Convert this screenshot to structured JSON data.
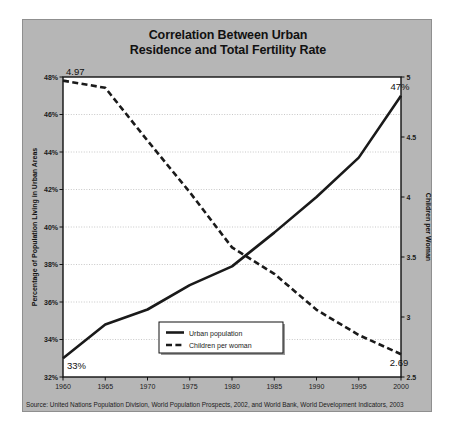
{
  "title": {
    "line1": "Correlation Between Urban",
    "line2": "Residence and Total Fertility Rate"
  },
  "source": "Source: United Nations Population Division, World Population Prospects, 2002, and World Bank, World Development Indicators, 2003",
  "legend": {
    "items": [
      {
        "label": "Urban population",
        "style": "solid"
      },
      {
        "label": "Children per woman",
        "style": "dashed"
      }
    ]
  },
  "annotations": {
    "urban_start": "33%",
    "urban_end": "47%",
    "fertility_start": "4.97",
    "fertility_end": "2.69"
  },
  "colors": {
    "frame": "#b6b6b6",
    "plot_background": "#ffffff",
    "line": "#1a1a1a",
    "grid": "#b0b0b0",
    "text": "#111111"
  },
  "chart_data": {
    "type": "line",
    "title": "Correlation Between Urban Residence and Total Fertility Rate",
    "xlabel": "",
    "ylabel": "Percentage of Population Living in Urban Areas",
    "y2label": "Children per Woman",
    "grid": true,
    "legend_position": "inside-bottom-center",
    "x": [
      1960,
      1965,
      1970,
      1975,
      1980,
      1985,
      1990,
      1995,
      2000
    ],
    "xtick_labels": [
      "1960",
      "1965",
      "1970",
      "1975",
      "1980",
      "1985",
      "1990",
      "1995",
      "2000"
    ],
    "xlim": [
      1960,
      2000
    ],
    "ylim": [
      32,
      48
    ],
    "ytick_labels": [
      "32%",
      "34%",
      "36%",
      "38%",
      "40%",
      "42%",
      "44%",
      "46%",
      "48%"
    ],
    "ytick_values": [
      32,
      34,
      36,
      38,
      40,
      42,
      44,
      46,
      48
    ],
    "y2lim": [
      2.5,
      5.0
    ],
    "y2tick_labels": [
      "2.5",
      "3",
      "3.5",
      "4",
      "4.5",
      "5"
    ],
    "y2tick_values": [
      2.5,
      3.0,
      3.5,
      4.0,
      4.5,
      5.0
    ],
    "series": [
      {
        "name": "Urban population",
        "axis": "left",
        "style": "solid",
        "unit": "%",
        "values": [
          33.0,
          34.8,
          35.6,
          36.9,
          37.9,
          39.7,
          41.6,
          43.7,
          47.0
        ]
      },
      {
        "name": "Children per woman",
        "axis": "right",
        "style": "dashed",
        "unit": "children",
        "values": [
          4.97,
          4.91,
          4.47,
          4.04,
          3.58,
          3.36,
          3.06,
          2.85,
          2.69
        ]
      }
    ]
  }
}
